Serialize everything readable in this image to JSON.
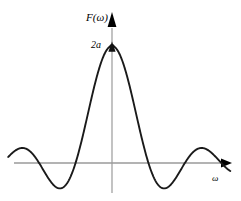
{
  "figure": {
    "background_color": "#ffffff",
    "curve_color": "#1a1a1a",
    "axis_color": "#9a9a9a",
    "arrow_color": "#000000",
    "text_color": "#000000"
  },
  "labels": {
    "y_axis_label": "F(ω)",
    "x_axis_label": "ω",
    "peak_value_label": "2a"
  },
  "icons": {
    "y_axis_arrowhead": "up-arrowhead-icon",
    "x_axis_arrowhead": "right-arrowhead-icon",
    "peak_marker": "peak-marker-triangle-icon"
  },
  "chart_data": {
    "type": "line",
    "title": "",
    "subtitle": "",
    "xlabel": "ω",
    "ylabel": "F(ω)",
    "function": "F(ω) = 2a·sinc(ωa) = 2a·sin(ωa)/(ωa)",
    "grid": false,
    "legend": null,
    "legend_position": "none",
    "peak_value": "2a",
    "peak_value_numeric": 1.0,
    "peak_x": 0,
    "symmetric": true,
    "xlim": [
      -10.2,
      10.2
    ],
    "ylim": [
      -0.25,
      1.08
    ],
    "y_ticks": [
      {
        "value": 1.0,
        "label": "2a"
      }
    ],
    "x_ticks": [],
    "zero_crossings": [
      -9.42,
      -6.28,
      -3.14,
      3.14,
      6.28,
      9.42
    ],
    "lobes": [
      {
        "name": "main-lobe",
        "center_x": 0.0,
        "peak_y": 1.0
      },
      {
        "name": "side-lobe-negative-1",
        "center_x": -4.49,
        "peak_y": -0.217
      },
      {
        "name": "side-lobe-negative-2",
        "center_x": -7.73,
        "peak_y": 0.128
      },
      {
        "name": "side-lobe-negative-3",
        "center_x": -10.9,
        "peak_y": -0.091
      },
      {
        "name": "side-lobe-positive-1",
        "center_x": 4.49,
        "peak_y": -0.217
      },
      {
        "name": "side-lobe-positive-2",
        "center_x": 7.73,
        "peak_y": 0.128
      },
      {
        "name": "side-lobe-positive-3",
        "center_x": 10.9,
        "peak_y": -0.091
      }
    ],
    "series": [
      {
        "name": "F(ω)",
        "color": "#1a1a1a",
        "x": [
          -10.2,
          -9.9,
          -9.6,
          -9.42,
          -9.0,
          -8.6,
          -8.2,
          -7.73,
          -7.3,
          -6.9,
          -6.6,
          -6.28,
          -5.9,
          -5.5,
          -5.0,
          -4.49,
          -4.0,
          -3.6,
          -3.14,
          -2.8,
          -2.4,
          -2.0,
          -1.6,
          -1.2,
          -0.8,
          -0.4,
          0.0,
          0.4,
          0.8,
          1.2,
          1.6,
          2.0,
          2.4,
          2.8,
          3.14,
          3.6,
          4.0,
          4.49,
          5.0,
          5.5,
          5.9,
          6.28,
          6.6,
          6.9,
          7.3,
          7.73,
          8.2,
          8.6,
          9.0,
          9.42,
          9.6,
          9.9,
          10.2
        ],
        "y": [
          -0.068,
          -0.048,
          -0.015,
          0.0,
          0.046,
          0.089,
          0.118,
          0.128,
          0.114,
          0.072,
          0.029,
          0.0,
          -0.057,
          -0.119,
          -0.191,
          -0.217,
          -0.189,
          -0.124,
          0.0,
          0.12,
          0.281,
          0.455,
          0.624,
          0.776,
          0.897,
          0.974,
          1.0,
          0.974,
          0.897,
          0.776,
          0.624,
          0.455,
          0.281,
          0.12,
          0.0,
          -0.124,
          -0.189,
          -0.217,
          -0.191,
          -0.119,
          -0.057,
          0.0,
          0.029,
          0.072,
          0.114,
          0.128,
          0.118,
          0.089,
          0.046,
          0.0,
          -0.015,
          -0.048,
          -0.068
        ]
      }
    ]
  }
}
